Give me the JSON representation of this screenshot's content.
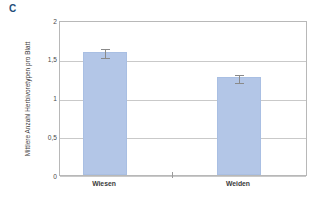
{
  "panel": {
    "letter": "C",
    "letter_color": "#1f4e79"
  },
  "chart_data": {
    "type": "bar",
    "title": "",
    "xlabel": "",
    "ylabel": "Mittlere Anzahl Herbivoretypen pro Blatt",
    "categories": [
      "Wiesen",
      "Weiden"
    ],
    "values": [
      1.59,
      1.26
    ],
    "errors": [
      0.06,
      0.05
    ],
    "ylim": [
      0,
      2
    ],
    "yticks": [
      0,
      0.5,
      1,
      1.5,
      2
    ],
    "ytick_labels": [
      "0",
      "0,5",
      "1",
      "1,5",
      "2"
    ],
    "grid": true,
    "legend": "none",
    "bar_color": "#b3c6e7",
    "error_bar_color": "#8a8a8a"
  }
}
